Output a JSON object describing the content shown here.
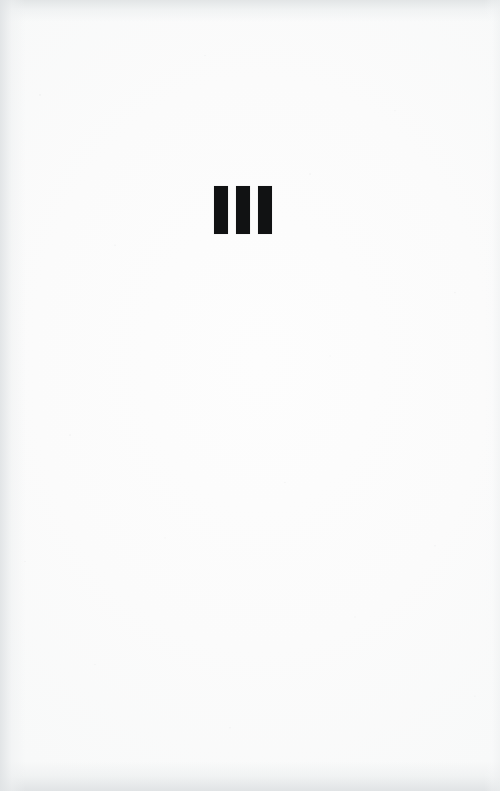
{
  "document": {
    "kind": "scanned-book-page",
    "page_type": "part-divider",
    "numeral_text": "III",
    "numeral_value": 3,
    "numeral_system": "roman",
    "body_text": "",
    "page_number": "",
    "running_head": "",
    "colors": {
      "paper": "#fbfcfc",
      "paper_center": "#fdfdfd",
      "ink": "#111213",
      "scan_edge": "#e1e4e5"
    },
    "numeral_glyph": {
      "label": "III",
      "stroke_count": 3,
      "block_left_px": 214,
      "block_top_px": 186,
      "stroke_width_px": 14,
      "stroke_height_px": 48,
      "stroke_gap_px": 8,
      "block_width_px": 56,
      "block_center_x_px": 242
    },
    "canvas": {
      "width_px": 500,
      "height_px": 791
    }
  }
}
